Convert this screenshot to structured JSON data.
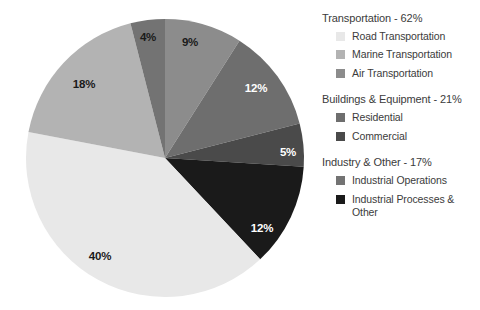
{
  "chart_data": {
    "type": "pie",
    "title": "",
    "legend_position": "right",
    "start_angle_deg": 0,
    "direction": "clockwise",
    "categories": [
      "Air Transportation",
      "Residential",
      "Commercial",
      "Industrial Processes & Other",
      "Road Transportation",
      "Marine Transportation",
      "Industrial Operations"
    ],
    "values": [
      9,
      12,
      5,
      12,
      40,
      18,
      4
    ],
    "labels": [
      "9%",
      "12%",
      "5%",
      "12%",
      "40%",
      "18%",
      "4%"
    ],
    "colors": [
      "#8c8c8c",
      "#6e6e6e",
      "#4a4a4a",
      "#1a1a1a",
      "#e8e8e8",
      "#b3b3b3",
      "#737373"
    ],
    "slices": [
      {
        "label": "9%",
        "value": 9,
        "color": "#8c8c8c",
        "label_color": "dark",
        "label_x": 190,
        "label_y": 42
      },
      {
        "label": "12%",
        "value": 12,
        "color": "#6e6e6e",
        "label_color": "light",
        "label_x": 256,
        "label_y": 88
      },
      {
        "label": "5%",
        "value": 5,
        "color": "#4a4a4a",
        "label_color": "light",
        "label_x": 288,
        "label_y": 152
      },
      {
        "label": "12%",
        "value": 12,
        "color": "#1a1a1a",
        "label_color": "light",
        "label_x": 262,
        "label_y": 228
      },
      {
        "label": "40%",
        "value": 40,
        "color": "#e8e8e8",
        "label_color": "dark",
        "label_x": 100,
        "label_y": 256
      },
      {
        "label": "18%",
        "value": 18,
        "color": "#b3b3b3",
        "label_color": "dark",
        "label_x": 84,
        "label_y": 84
      },
      {
        "label": "4%",
        "value": 4,
        "color": "#737373",
        "label_color": "dark",
        "label_x": 148,
        "label_y": 37
      }
    ],
    "geometry": {
      "cx": 165,
      "cy": 158,
      "r": 139
    }
  },
  "legend": {
    "groups": [
      {
        "title": "Transportation - 62%",
        "items": [
          {
            "label": "Road Transportation",
            "color": "#e8e8e8"
          },
          {
            "label": "Marine Transportation",
            "color": "#b3b3b3"
          },
          {
            "label": "Air Transportation",
            "color": "#8c8c8c"
          }
        ]
      },
      {
        "title": "Buildings & Equipment - 21%",
        "items": [
          {
            "label": "Residential",
            "color": "#6e6e6e"
          },
          {
            "label": "Commercial",
            "color": "#4a4a4a"
          }
        ]
      },
      {
        "title": "Industry & Other - 17%",
        "items": [
          {
            "label": "Industrial Operations",
            "color": "#737373"
          },
          {
            "label": "Industrial Processes & Other",
            "color": "#1a1a1a"
          }
        ]
      }
    ]
  }
}
